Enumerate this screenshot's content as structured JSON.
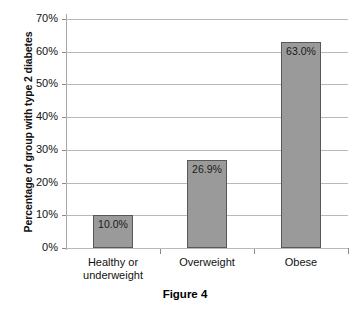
{
  "chart_data": {
    "type": "bar",
    "title": "",
    "caption": "Figure 4",
    "xlabel": "",
    "ylabel": "Percentage of group with type 2 diabetes",
    "categories": [
      "Healthy or underweight",
      "Overweight",
      "Obese"
    ],
    "category_lines": [
      [
        "Healthy or",
        "underweight"
      ],
      [
        "Overweight"
      ],
      [
        "Obese"
      ]
    ],
    "values": [
      10.0,
      26.9,
      63.0
    ],
    "value_labels": [
      "10.0%",
      "26.9%",
      "63.0%"
    ],
    "ylim": [
      0,
      70
    ],
    "ytick_values": [
      0,
      10,
      20,
      30,
      40,
      50,
      60,
      70
    ],
    "ytick_labels": [
      "0%",
      "10%",
      "20%",
      "30%",
      "40%",
      "50%",
      "60%",
      "70%"
    ],
    "grid": true,
    "legend": "none",
    "bar_color": "#9a9a9a",
    "bar_border_color": "#585858",
    "gridline_color": "#b9b9b9",
    "axis_color": "#8a8a8a",
    "background": "#ffffff"
  }
}
